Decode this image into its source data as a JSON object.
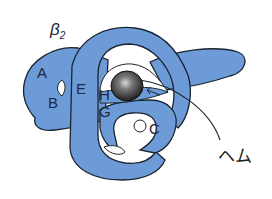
{
  "diagram": {
    "title": "β",
    "title_subscript": "2",
    "helix_labels": {
      "A": "A",
      "B": "B",
      "C": "C",
      "E": "E",
      "G": "G",
      "H": "H"
    },
    "heme_label": "ヘム",
    "colors": {
      "chain_fill": "#6d9bd8",
      "outline": "#1b2430",
      "heme": "#3a3a3a",
      "background": "#ffffff"
    }
  }
}
